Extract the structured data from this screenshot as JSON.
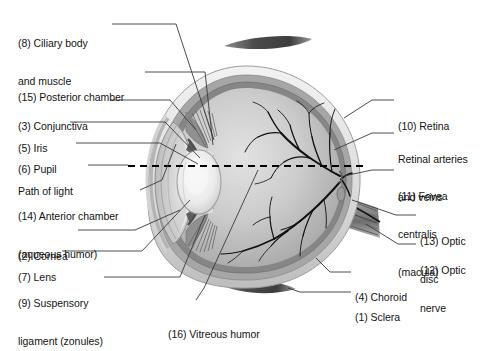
{
  "diagram": {
    "view": "sagittal cross-section, anterior to the left, posterior to the right",
    "style": "grayscale anatomical illustration with leader lines to numbered labels",
    "colors": {
      "background": "#ffffff",
      "text": "#141414",
      "leader_line": "#3a3a3a",
      "sclera_outer": "#e9e9e9",
      "sclera_mid": "#cfcfcf",
      "choroid": "#9a9a9a",
      "retina": "#7d7d7d",
      "vitreous_light": "#d8d8d8",
      "vitreous_dark": "#a9a9a9",
      "lens": "#efefef",
      "vessels": "#111111",
      "muscle": "#555555",
      "optic_nerve": "#8d8d8d",
      "path_of_light_dash": "#000000"
    }
  },
  "labels_left": [
    {
      "id": "ciliary-body",
      "number": "(8)",
      "lines": [
        "(8) Ciliary body",
        "and muscle"
      ],
      "x": 18,
      "y": 12
    },
    {
      "id": "posterior-chamber",
      "number": "(15)",
      "lines": [
        "(15) Posterior chamber"
      ],
      "x": 18,
      "y": 66
    },
    {
      "id": "conjunctiva",
      "number": "(3)",
      "lines": [
        "(3) Conjunctiva"
      ],
      "x": 18,
      "y": 95
    },
    {
      "id": "iris",
      "number": "(5)",
      "lines": [
        "(5) Iris"
      ],
      "x": 18,
      "y": 117
    },
    {
      "id": "pupil",
      "number": "(6)",
      "lines": [
        "(6) Pupil"
      ],
      "x": 18,
      "y": 138
    },
    {
      "id": "path-of-light",
      "number": "",
      "lines": [
        "Path of light"
      ],
      "x": 18,
      "y": 160
    },
    {
      "id": "anterior-chamber",
      "number": "(14)",
      "lines": [
        "(14) Anterior chamber",
        "(aqueous humor)"
      ],
      "x": 18,
      "y": 185
    },
    {
      "id": "cornea",
      "number": "(2)",
      "lines": [
        "(2) Cornea"
      ],
      "x": 18,
      "y": 225
    },
    {
      "id": "lens",
      "number": "(7)",
      "lines": [
        "(7) Lens"
      ],
      "x": 18,
      "y": 246
    },
    {
      "id": "suspensory-ligament",
      "number": "(9)",
      "lines": [
        "(9) Suspensory",
        "ligament (zonules)"
      ],
      "x": 18,
      "y": 272
    }
  ],
  "labels_right": [
    {
      "id": "retina",
      "number": "(10)",
      "lines": [
        "(10) Retina"
      ],
      "x": 398,
      "y": 95
    },
    {
      "id": "retinal-vessels",
      "number": "",
      "lines": [
        "Retinal arteries",
        "and veins"
      ],
      "x": 398,
      "y": 128
    },
    {
      "id": "fovea-centralis",
      "number": "(11)",
      "lines": [
        "(11) Fovea",
        "centralis",
        "(macula)"
      ],
      "x": 398,
      "y": 165
    },
    {
      "id": "optic-disc",
      "number": "(13)",
      "lines": [
        "(13) Optic",
        "disc"
      ],
      "x": 420,
      "y": 210
    },
    {
      "id": "optic-nerve",
      "number": "(12)",
      "lines": [
        "(12) Optic",
        "nerve"
      ],
      "x": 420,
      "y": 239
    },
    {
      "id": "choroid",
      "number": "(4)",
      "lines": [
        "(4) Choroid"
      ],
      "x": 355,
      "y": 272
    },
    {
      "id": "sclera",
      "number": "(1)",
      "lines": [
        "(1) Sclera"
      ],
      "x": 355,
      "y": 292
    }
  ],
  "labels_bottom": [
    {
      "id": "vitreous-humor",
      "number": "(16)",
      "lines": [
        "(16) Vitreous humor"
      ],
      "x": 168,
      "y": 305
    }
  ],
  "structures": [
    {
      "id": "sclera",
      "number": 1,
      "name": "Sclera"
    },
    {
      "id": "cornea",
      "number": 2,
      "name": "Cornea"
    },
    {
      "id": "conjunctiva",
      "number": 3,
      "name": "Conjunctiva"
    },
    {
      "id": "choroid",
      "number": 4,
      "name": "Choroid"
    },
    {
      "id": "iris",
      "number": 5,
      "name": "Iris"
    },
    {
      "id": "pupil",
      "number": 6,
      "name": "Pupil"
    },
    {
      "id": "lens",
      "number": 7,
      "name": "Lens"
    },
    {
      "id": "ciliary-body",
      "number": 8,
      "name": "Ciliary body and muscle"
    },
    {
      "id": "suspensory-ligament",
      "number": 9,
      "name": "Suspensory ligament (zonules)"
    },
    {
      "id": "retina",
      "number": 10,
      "name": "Retina"
    },
    {
      "id": "fovea-centralis",
      "number": 11,
      "name": "Fovea centralis (macula)"
    },
    {
      "id": "optic-nerve",
      "number": 12,
      "name": "Optic nerve"
    },
    {
      "id": "optic-disc",
      "number": 13,
      "name": "Optic disc"
    },
    {
      "id": "anterior-chamber",
      "number": 14,
      "name": "Anterior chamber (aqueous humor)"
    },
    {
      "id": "posterior-chamber",
      "number": 15,
      "name": "Posterior chamber"
    },
    {
      "id": "vitreous-humor",
      "number": 16,
      "name": "Vitreous humor"
    }
  ],
  "unnumbered": [
    "Path of light",
    "Retinal arteries and veins"
  ]
}
